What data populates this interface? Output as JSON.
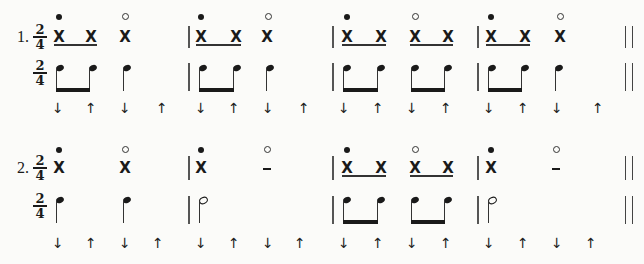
{
  "exercises": [
    {
      "number_label": "1.",
      "time_signature": {
        "top": "2",
        "bottom": "4"
      },
      "rhythm_line": {
        "beats": [
          {
            "x": 59,
            "accent": "filled",
            "symbol": "X"
          },
          {
            "x": 91,
            "accent": "",
            "symbol": "X"
          },
          {
            "x": 125,
            "accent": "open",
            "symbol": "X"
          },
          {
            "x": 201,
            "accent": "filled",
            "symbol": "X"
          },
          {
            "x": 236,
            "accent": "",
            "symbol": "X"
          },
          {
            "x": 267,
            "accent": "open",
            "symbol": "X"
          },
          {
            "x": 347,
            "accent": "filled",
            "symbol": "X"
          },
          {
            "x": 381,
            "accent": "",
            "symbol": "X"
          },
          {
            "x": 415,
            "accent": "open",
            "symbol": "X"
          },
          {
            "x": 448,
            "accent": "",
            "symbol": "X"
          },
          {
            "x": 491,
            "accent": "filled",
            "symbol": "X"
          },
          {
            "x": 525,
            "accent": "",
            "symbol": "X"
          },
          {
            "x": 560,
            "accent": "open",
            "symbol": "X"
          }
        ]
      },
      "strum_arrows": [
        "↓",
        "↑",
        "↓",
        "↑",
        "↓",
        "↑",
        "↓",
        "↑",
        "↓",
        "↑",
        "↓",
        "↑",
        "↓",
        "↑",
        "↓",
        "↑"
      ]
    },
    {
      "number_label": "2.",
      "time_signature": {
        "top": "2",
        "bottom": "4"
      },
      "rhythm_line": {
        "beats": [
          {
            "x": 59,
            "accent": "filled",
            "symbol": "X"
          },
          {
            "x": 125,
            "accent": "open",
            "symbol": "X"
          },
          {
            "x": 201,
            "accent": "filled",
            "symbol": "X"
          },
          {
            "x": 267,
            "accent": "open",
            "symbol": "–"
          },
          {
            "x": 347,
            "accent": "filled",
            "symbol": "X"
          },
          {
            "x": 381,
            "accent": "",
            "symbol": "X"
          },
          {
            "x": 415,
            "accent": "open",
            "symbol": "X"
          },
          {
            "x": 448,
            "accent": "",
            "symbol": "X"
          },
          {
            "x": 491,
            "accent": "filled",
            "symbol": "X"
          },
          {
            "x": 560,
            "accent": "open",
            "symbol": "–"
          }
        ]
      },
      "strum_arrows": [
        "↓",
        "↑",
        "↓",
        "↑",
        "↓",
        "↑",
        "↓",
        "↑",
        "↓",
        "↑",
        "↓",
        "↑",
        "↓",
        "↑",
        "↓",
        "↑"
      ]
    }
  ],
  "symbols": {
    "down_arrow": "↓",
    "up_arrow": "↑",
    "hit": "X",
    "rest": "–"
  }
}
